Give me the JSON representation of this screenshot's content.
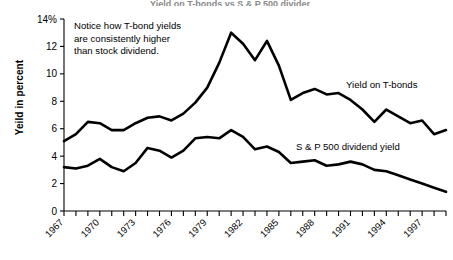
{
  "figure": {
    "clipped_title_fragment": "Yield on T-bonds vs S & P 500 dividend yield",
    "y_axis_title": "Yeild in percent",
    "annotation": "Notice how T-bond yields are consistently higher than stock dividend.",
    "annotation_lines": [
      "Notice how T-bond yields",
      "are consistently higher",
      "than stock dividend."
    ],
    "series_labels": {
      "tbond": "Yield on T-bonds",
      "sp500": "S & P 500 dividend yield"
    },
    "colors": {
      "line": "#000000",
      "axis": "#000000",
      "background": "#ffffff"
    }
  },
  "chart_data": {
    "type": "line",
    "title": "Yield on T-bonds vs S & P 500 dividend yield",
    "xlabel": "",
    "ylabel": "Yeild in percent",
    "ylim": [
      0,
      14
    ],
    "yticks": [
      0,
      2,
      4,
      6,
      8,
      10,
      12,
      14
    ],
    "ytick_labels": [
      "0",
      "2",
      "4",
      "6",
      "8",
      "10",
      "12",
      "14%"
    ],
    "xlim": [
      1967,
      1999
    ],
    "xticks": [
      1967,
      1968,
      1969,
      1970,
      1971,
      1972,
      1973,
      1974,
      1975,
      1976,
      1977,
      1978,
      1979,
      1980,
      1981,
      1982,
      1983,
      1984,
      1985,
      1986,
      1987,
      1988,
      1989,
      1990,
      1991,
      1992,
      1993,
      1994,
      1995,
      1996,
      1997,
      1998,
      1999
    ],
    "xtick_labels_shown": [
      "1967",
      "1970",
      "1973",
      "1976",
      "1979",
      "1982",
      "1985",
      "1988",
      "1991",
      "1994",
      "1997"
    ],
    "xtick_label_interval_years": 3,
    "grid": false,
    "legend": "inline-labels",
    "x": [
      1967,
      1968,
      1969,
      1970,
      1971,
      1972,
      1973,
      1974,
      1975,
      1976,
      1977,
      1978,
      1979,
      1980,
      1981,
      1982,
      1983,
      1984,
      1985,
      1986,
      1987,
      1988,
      1989,
      1990,
      1991,
      1992,
      1993,
      1994,
      1995,
      1996,
      1997,
      1998,
      1999
    ],
    "series": [
      {
        "name": "Yield on T-bonds",
        "values": [
          5.1,
          5.6,
          6.5,
          6.4,
          5.9,
          5.9,
          6.4,
          6.8,
          6.9,
          6.6,
          7.1,
          7.9,
          9.0,
          10.8,
          13.0,
          12.2,
          11.0,
          12.4,
          10.6,
          8.1,
          8.6,
          8.9,
          8.5,
          8.6,
          8.1,
          7.4,
          6.5,
          7.4,
          6.9,
          6.4,
          6.6,
          5.6,
          5.9
        ],
        "units": "percent"
      },
      {
        "name": "S & P 500 dividend yield",
        "values": [
          3.2,
          3.1,
          3.3,
          3.8,
          3.2,
          2.9,
          3.5,
          4.6,
          4.4,
          3.9,
          4.4,
          5.3,
          5.4,
          5.3,
          5.9,
          5.4,
          4.5,
          4.7,
          4.3,
          3.5,
          3.6,
          3.7,
          3.3,
          3.4,
          3.6,
          3.4,
          3.0,
          2.9,
          2.6,
          2.3,
          2.0,
          1.7,
          1.4
        ],
        "units": "percent"
      }
    ]
  }
}
